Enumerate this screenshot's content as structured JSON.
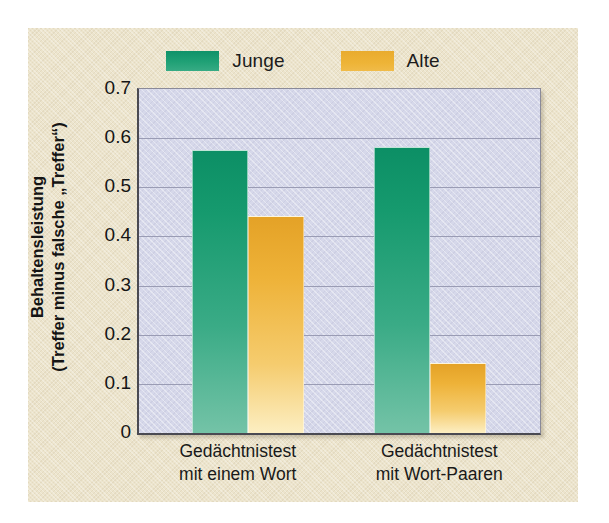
{
  "figure": {
    "background_color": "#ece4cc",
    "plot_background_color": "#d6d8ea",
    "page_background_color": "#ffffff"
  },
  "legend": {
    "position": "top-center",
    "entries": [
      {
        "label": "Junge",
        "color": "#1fa075",
        "swatch": "legend-swatch-young"
      },
      {
        "label": "Alte",
        "color": "#eeb338",
        "swatch": "legend-swatch-old"
      }
    ]
  },
  "axes": {
    "y_title_line1": "Behaltensleistung",
    "y_title_line2": "(Treffer minus falsche „Treffer“)",
    "y_ticks": [
      "0.7",
      "0.6",
      "0.5",
      "0.4",
      "0.3",
      "0.2",
      "0.1",
      "0"
    ],
    "x_tick_labels": [
      "Gedächtnistest\nmit einem Wort",
      "Gedächtnistest\nmit Wort-Paaren"
    ]
  },
  "chart_data": {
    "type": "bar",
    "title": "",
    "subtitle": "",
    "xlabel": "",
    "ylabel": "Behaltensleistung (Treffer minus falsche „Treffer“)",
    "categories": [
      "Gedächtnistest mit einem Wort",
      "Gedächtnistest mit Wort-Paaren"
    ],
    "series": [
      {
        "name": "Junge",
        "color": "#1fa075",
        "values": [
          0.575,
          0.583
        ]
      },
      {
        "name": "Alte",
        "color": "#eeb338",
        "values": [
          0.442,
          0.143
        ]
      }
    ],
    "ylim": [
      0,
      0.7
    ],
    "ytick_values": [
      0.7,
      0.6,
      0.5,
      0.4,
      0.3,
      0.2,
      0.1,
      0
    ],
    "grid": true,
    "grid_axis": "y",
    "legend_position": "top-center",
    "bar_gap_within_group": 0,
    "annotations": []
  }
}
